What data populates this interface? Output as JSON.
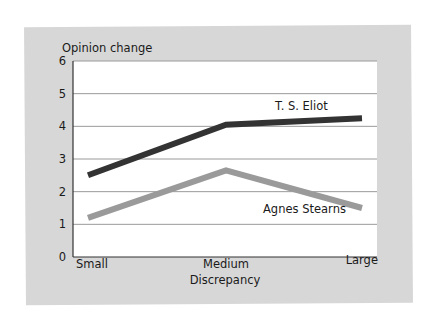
{
  "chart_data": {
    "type": "line",
    "title": "",
    "ylabel": "Opinion change",
    "xlabel": "Discrepancy",
    "categories": [
      "Small",
      "Medium",
      "Large"
    ],
    "yticks": [
      "0",
      "1",
      "2",
      "3",
      "4",
      "5",
      "6"
    ],
    "ylim": [
      0,
      6
    ],
    "grid": true,
    "legend_position": "inline labels",
    "series": [
      {
        "name": "T. S. Eliot",
        "values": [
          2.5,
          4.05,
          4.25
        ],
        "color": "#333333"
      },
      {
        "name": "Agnes Stearns",
        "values": [
          1.2,
          2.65,
          1.5
        ],
        "color": "#9a9a9a"
      }
    ]
  },
  "colors": {
    "card_background": "#d7d7d7",
    "plot_background": "#ffffff",
    "gridline": "#9a9a9a",
    "axis": "#333333"
  }
}
